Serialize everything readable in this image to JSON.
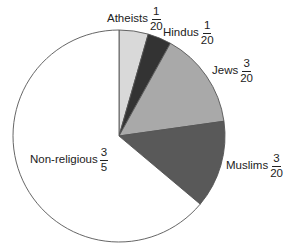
{
  "chart_data": {
    "type": "pie",
    "title": "",
    "start_angle": "12 o'clock",
    "direction": "clockwise",
    "slices": [
      {
        "name": "Atheists",
        "fraction": "1/20",
        "numerator": "1",
        "denominator": "20",
        "value": 0.05,
        "color": "#d9d9d9"
      },
      {
        "name": "Hindus",
        "fraction": "1/20",
        "numerator": "1",
        "denominator": "20",
        "value": 0.05,
        "color": "#333333"
      },
      {
        "name": "Jews",
        "fraction": "3/20",
        "numerator": "3",
        "denominator": "20",
        "value": 0.15,
        "color": "#a9a9a9"
      },
      {
        "name": "Muslims",
        "fraction": "3/20",
        "numerator": "3",
        "denominator": "20",
        "value": 0.15,
        "color": "#595959"
      },
      {
        "name": "Non-religious",
        "fraction": "3/5",
        "numerator": "3",
        "denominator": "5",
        "value": 0.6,
        "color": "#ffffff"
      }
    ],
    "drawn_boundaries_deg": [
      0,
      16,
      29,
      82,
      130,
      360
    ],
    "legend": "none (inline labels)"
  },
  "geometry": {
    "cx": 119,
    "cy": 136,
    "r": 106,
    "stroke": "#555555"
  },
  "labels": [
    {
      "name": "Atheists",
      "left": 107,
      "top": 6
    },
    {
      "name": "Hindus",
      "left": 163,
      "top": 20
    },
    {
      "name": "Jews",
      "left": 212,
      "top": 58
    },
    {
      "name": "Muslims",
      "left": 226,
      "top": 153
    },
    {
      "name": "Non-religious",
      "left": 30,
      "top": 147
    }
  ]
}
